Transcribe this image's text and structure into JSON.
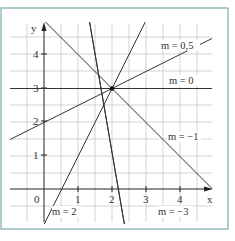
{
  "diagram": {
    "frame_color": "#7fa9b3",
    "grid_color": "#c8c8c8",
    "axis_color": "#222222",
    "line_color": "#333333",
    "axes": {
      "x_label": "x",
      "y_label": "y",
      "origin_label": "0",
      "x_ticks": [
        "1",
        "2",
        "3",
        "4"
      ],
      "y_ticks": [
        "1",
        "2",
        "3",
        "4"
      ]
    },
    "point": {
      "x": 2,
      "y": 3
    },
    "lines": [
      {
        "slope": 0.5,
        "label": "m = 0,5"
      },
      {
        "slope": 0,
        "label": "m = 0"
      },
      {
        "slope": -1,
        "label": "m = −1"
      },
      {
        "slope": -3,
        "label": "m = −3"
      },
      {
        "slope": 2,
        "label": "m = 2"
      }
    ]
  }
}
